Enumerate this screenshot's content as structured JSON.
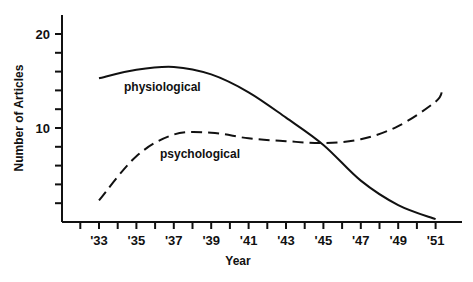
{
  "chart_data": {
    "type": "line",
    "title": "",
    "xlabel": "Year",
    "ylabel": "Number of Articles",
    "x": [
      "'33",
      "'35",
      "'37",
      "'39",
      "'41",
      "'43",
      "'45",
      "'47",
      "'49",
      "'51"
    ],
    "x_numeric": [
      1933,
      1935,
      1937,
      1939,
      1941,
      1943,
      1945,
      1947,
      1949,
      1951
    ],
    "ylim": [
      0,
      22
    ],
    "xlim": [
      1932,
      1952
    ],
    "y_ticks": [
      2,
      4,
      6,
      8,
      10,
      12,
      14,
      16,
      18,
      20
    ],
    "y_tick_labels": {
      "10": "10",
      "20": "20"
    },
    "grid": false,
    "legend": "inline labels",
    "series": [
      {
        "name": "physiological",
        "style": "solid",
        "values": [
          15.3,
          16.2,
          16.5,
          15.7,
          13.8,
          11.1,
          8.2,
          4.4,
          1.8,
          0.3
        ]
      },
      {
        "name": "psychological",
        "style": "dashed",
        "values": [
          2.3,
          7.0,
          9.3,
          9.5,
          8.9,
          8.6,
          8.4,
          8.8,
          10.2,
          12.8
        ]
      }
    ],
    "annotations": [
      {
        "text": "physiological",
        "near": "'36, 15"
      },
      {
        "text": "psychological",
        "near": "'38, 7.5"
      }
    ]
  },
  "labels": {
    "y_axis_title": "Number of Articles",
    "x_axis_title": "Year",
    "y20": "20",
    "y10": "10",
    "x_ticks": [
      "'33",
      "'35",
      "'37",
      "'39",
      "'41",
      "'43",
      "'45",
      "'47",
      "'49",
      "'51"
    ],
    "series_physiological": "physiological",
    "series_psychological": "psychological"
  }
}
